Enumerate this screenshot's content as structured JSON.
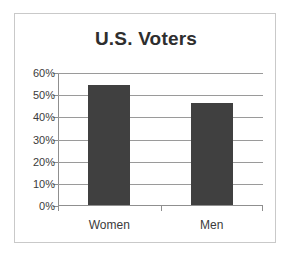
{
  "chart_data": {
    "type": "bar",
    "title": "U.S. Voters",
    "categories": [
      "Women",
      "Men"
    ],
    "values": [
      54,
      46
    ],
    "value_suffix": "%",
    "xlabel": "",
    "ylabel": "",
    "ylim": [
      0,
      60
    ],
    "ytick_step": 10,
    "ytick_labels": [
      "0%",
      "10%",
      "20%",
      "30%",
      "40%",
      "50%",
      "60%"
    ],
    "ytick_values": [
      0,
      10,
      20,
      30,
      40,
      50,
      60
    ],
    "grid": true,
    "legend": "none",
    "series": [
      {
        "name": "U.S. Voters",
        "values": [
          54,
          46
        ],
        "color": "#404040"
      }
    ],
    "colors": {
      "bar_fill": "#404040",
      "gridline": "#9a9a9a",
      "axis_line": "#8f8f8f",
      "frame_border": "#c9c9c9",
      "title_text": "#2e2e2e",
      "tick_text": "#3b3b3b",
      "background": "#ffffff"
    }
  }
}
